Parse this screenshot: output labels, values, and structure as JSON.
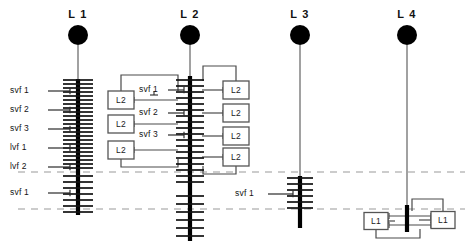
{
  "figure": {
    "background_color": "#ffffff",
    "stem_color": "#000000",
    "node_color": "#000000",
    "connector_color": "#4a4a4a",
    "dashed_color": "#9a9a9a",
    "box_border_color": "#555555"
  },
  "columns": [
    {
      "id": "L1",
      "title": "L 1",
      "x": 78
    },
    {
      "id": "L2",
      "title": "L 2",
      "x": 190
    },
    {
      "id": "L3",
      "title": "L 3",
      "x": 300
    },
    {
      "id": "L4",
      "title": "L 4",
      "x": 407
    }
  ],
  "nodes": [
    {
      "column": "L1",
      "cx": 78,
      "cy": 35,
      "r": 10
    },
    {
      "column": "L2",
      "cx": 190,
      "cy": 35,
      "r": 10
    },
    {
      "column": "L3",
      "cx": 300,
      "cy": 35,
      "r": 10
    },
    {
      "column": "L4",
      "cx": 407,
      "cy": 35,
      "r": 10
    }
  ],
  "stems": [
    {
      "column": "L1",
      "x": 78,
      "thin_top": 45,
      "thin_bottom": 79,
      "thick_top": 79,
      "thick_bottom": 215
    },
    {
      "column": "L2",
      "x": 190,
      "thin_top": 45,
      "thin_bottom": 76,
      "thick_top": 76,
      "thick_bottom": 241
    },
    {
      "column": "L3",
      "x": 300,
      "thin_top": 45,
      "thin_bottom": 176,
      "thick_top": 176,
      "thick_bottom": 228
    },
    {
      "column": "L4",
      "x": 407,
      "thin_top": 45,
      "thin_bottom": 205,
      "thick_top": 205,
      "thick_bottom": 232
    }
  ],
  "dashed_lines": [
    {
      "name": "upper-reference-line",
      "y": 172,
      "x1": 18,
      "x2": 465
    },
    {
      "name": "lower-reference-line",
      "y": 209,
      "x1": 18,
      "x2": 465
    }
  ],
  "left_labels": [
    {
      "text": "svf 1",
      "label_x": 10,
      "label_y": 91,
      "leader_y": 91,
      "leader_x1": 48,
      "leader_x2": 70
    },
    {
      "text": "svf 2",
      "label_x": 10,
      "label_y": 110,
      "leader_y": 110,
      "leader_x1": 48,
      "leader_x2": 70
    },
    {
      "text": "svf 3",
      "label_x": 10,
      "label_y": 129,
      "leader_y": 129,
      "leader_x1": 48,
      "leader_x2": 70
    },
    {
      "text": "lvf 1",
      "label_x": 10,
      "label_y": 148,
      "leader_y": 148,
      "leader_x1": 48,
      "leader_x2": 70
    },
    {
      "text": "lvf 2",
      "label_x": 10,
      "label_y": 167,
      "leader_y": 167,
      "leader_x1": 48,
      "leader_x2": 70
    },
    {
      "text": "svf 1",
      "label_x": 10,
      "label_y": 193,
      "leader_y": 193,
      "leader_x1": 48,
      "leader_x2": 70
    }
  ],
  "l2_labels": [
    {
      "text": "svf 1",
      "label_x": 139,
      "label_y": 90,
      "leader_y": 90,
      "leader_x1": 168,
      "leader_x2": 184
    },
    {
      "text": "svf 2",
      "label_x": 139,
      "label_y": 113,
      "leader_y": 113,
      "leader_x1": 168,
      "leader_x2": 184
    },
    {
      "text": "svf 3",
      "label_x": 139,
      "label_y": 135,
      "leader_y": 135,
      "leader_x1": 168,
      "leader_x2": 184
    }
  ],
  "l3_labels": [
    {
      "text": "svf 1",
      "label_x": 235,
      "label_y": 194,
      "leader_y": 194,
      "leader_x1": 268,
      "leader_x2": 293
    }
  ],
  "boxes": [
    {
      "label": "L2",
      "cx": 121,
      "cy": 100,
      "w": 26,
      "h": 18,
      "side": "left",
      "column": "L2"
    },
    {
      "label": "L2",
      "cx": 121,
      "cy": 124,
      "w": 26,
      "h": 18,
      "side": "left",
      "column": "L2"
    },
    {
      "label": "L2",
      "cx": 121,
      "cy": 150,
      "w": 26,
      "h": 18,
      "side": "left",
      "column": "L2"
    },
    {
      "label": "L2",
      "cx": 236,
      "cy": 90,
      "w": 26,
      "h": 18,
      "side": "right",
      "column": "L2"
    },
    {
      "label": "L2",
      "cx": 236,
      "cy": 113,
      "w": 26,
      "h": 18,
      "side": "right",
      "column": "L2"
    },
    {
      "label": "L2",
      "cx": 236,
      "cy": 136,
      "w": 26,
      "h": 18,
      "side": "right",
      "column": "L2"
    },
    {
      "label": "L2",
      "cx": 236,
      "cy": 157,
      "w": 26,
      "h": 18,
      "side": "right",
      "column": "L2"
    },
    {
      "label": "L1",
      "cx": 376,
      "cy": 221,
      "w": 24,
      "h": 17,
      "side": "left",
      "column": "L4"
    },
    {
      "label": "L1",
      "cx": 443,
      "cy": 220,
      "w": 24,
      "h": 17,
      "side": "right",
      "column": "L4"
    }
  ],
  "ticks": {
    "L1": {
      "x": 78,
      "half_width": 15,
      "rows": [
        80,
        84,
        88,
        92,
        96,
        100,
        104,
        108,
        112,
        116,
        120,
        124,
        128,
        132,
        136,
        140,
        144,
        148,
        152,
        156,
        160,
        164,
        168,
        176,
        182,
        188,
        194,
        200,
        206,
        212
      ]
    },
    "L2": {
      "x": 190,
      "half_width": 14,
      "rows": [
        80,
        86,
        92,
        98,
        104,
        110,
        116,
        122,
        128,
        134,
        140,
        146,
        152,
        158,
        164,
        170,
        176,
        182,
        196,
        204,
        212,
        220,
        228,
        236
      ]
    },
    "L3": {
      "x": 300,
      "half_width": 13,
      "rows": [
        178,
        184,
        190,
        196,
        202,
        208
      ]
    },
    "L4": {
      "x": 407,
      "half_width": 0,
      "rows": []
    }
  }
}
